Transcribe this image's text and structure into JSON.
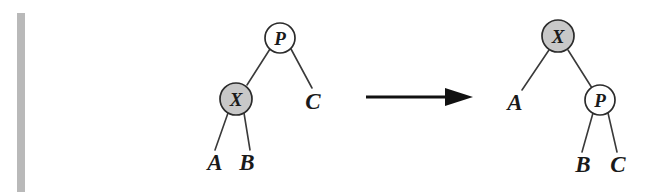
{
  "figure": {
    "caption": "",
    "background_color": "#ffffff",
    "arrow": {
      "name": "transforms-to-arrow",
      "symbol": "→",
      "direction": "right"
    },
    "margin_bar": {
      "name": "scan-margin-bar",
      "color": "#b9b9b9"
    },
    "colors": {
      "node_fill_highlight": "#c8c8c8",
      "node_fill_plain": "#ffffff",
      "node_stroke": "#2b2b2b",
      "edge_stroke": "#3a3a3a",
      "text": "#1a1a1a",
      "arrow": "#111111"
    },
    "trees": [
      {
        "name": "before-tree",
        "position": "left",
        "nodes": [
          {
            "id": "P",
            "label": "P",
            "shape": "circle",
            "fill": "#ffffff",
            "cx": 280,
            "cy": 38,
            "r": 15
          },
          {
            "id": "X",
            "label": "X",
            "shape": "circle",
            "fill": "#c8c8c8",
            "cx": 236,
            "cy": 99,
            "r": 16
          }
        ],
        "leaves": [
          {
            "id": "A",
            "label": "A",
            "x": 215,
            "y": 170
          },
          {
            "id": "B",
            "label": "B",
            "x": 247,
            "y": 170
          },
          {
            "id": "C",
            "label": "C",
            "x": 313,
            "y": 109
          }
        ],
        "edges": [
          {
            "from": "P",
            "to": "X"
          },
          {
            "from": "P",
            "to": "C"
          },
          {
            "from": "X",
            "to": "A"
          },
          {
            "from": "X",
            "to": "B"
          }
        ]
      },
      {
        "name": "after-tree",
        "position": "right",
        "nodes": [
          {
            "id": "X",
            "label": "X",
            "shape": "circle",
            "fill": "#c8c8c8",
            "cx": 558,
            "cy": 36,
            "r": 16
          },
          {
            "id": "P",
            "label": "P",
            "shape": "circle",
            "fill": "#ffffff",
            "cx": 600,
            "cy": 100,
            "r": 15
          }
        ],
        "leaves": [
          {
            "id": "A",
            "label": "A",
            "x": 509,
            "y": 110
          },
          {
            "id": "B",
            "label": "B",
            "x": 580,
            "y": 172
          },
          {
            "id": "C",
            "label": "C",
            "x": 614,
            "y": 172
          }
        ],
        "edges": [
          {
            "from": "X",
            "to": "A"
          },
          {
            "from": "X",
            "to": "P"
          },
          {
            "from": "P",
            "to": "B"
          },
          {
            "from": "P",
            "to": "C"
          }
        ]
      }
    ]
  }
}
